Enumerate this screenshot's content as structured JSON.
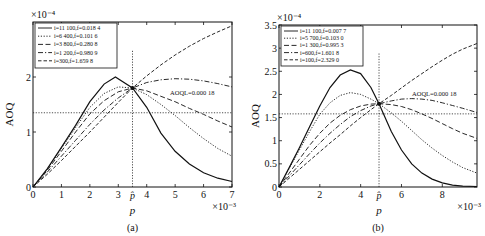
{
  "chart_data": [
    {
      "type": "line",
      "panel_label": "(a)",
      "xlabel": "p",
      "ylabel": "AOQ",
      "x_multiplier": "×10⁻³",
      "y_multiplier": "×10⁻⁴",
      "xlim": [
        0,
        7
      ],
      "ylim": [
        0,
        3
      ],
      "xticks": [
        0,
        1,
        2,
        3,
        4,
        5,
        6,
        7
      ],
      "yticks": [
        0,
        1,
        2
      ],
      "p_hat": 3.5,
      "p_hat_label": "p̂",
      "annotation": "AOQL=0.000 18",
      "hline": 1.35,
      "grid": false,
      "legend_position": "upper left",
      "series": [
        {
          "name": "i=11 100,f=0.018 4",
          "style": "solid",
          "x": [
            0,
            0.5,
            1,
            1.5,
            2,
            2.5,
            2.9,
            3.5,
            4,
            4.5,
            5,
            5.5,
            6,
            6.5,
            7
          ],
          "y": [
            0,
            0.33,
            0.72,
            1.12,
            1.55,
            1.87,
            2.0,
            1.8,
            1.45,
            0.98,
            0.65,
            0.42,
            0.26,
            0.16,
            0.1
          ]
        },
        {
          "name": "i=6 400,f=0.101 6",
          "style": "dotted",
          "x": [
            0,
            0.5,
            1,
            1.5,
            2,
            2.5,
            3,
            3.5,
            4,
            4.5,
            5,
            5.5,
            6,
            6.5,
            7
          ],
          "y": [
            0,
            0.32,
            0.7,
            1.08,
            1.45,
            1.7,
            1.82,
            1.8,
            1.68,
            1.5,
            1.3,
            1.08,
            0.88,
            0.7,
            0.56
          ]
        },
        {
          "name": "i=3 800,f=0.280 8",
          "style": "dashed",
          "x": [
            0,
            0.5,
            1,
            1.5,
            2,
            2.5,
            3,
            3.5,
            4,
            4.5,
            5,
            5.5,
            6,
            6.5,
            7
          ],
          "y": [
            0,
            0.3,
            0.65,
            1.0,
            1.33,
            1.57,
            1.73,
            1.8,
            1.75,
            1.65,
            1.55,
            1.43,
            1.32,
            1.2,
            1.09
          ]
        },
        {
          "name": "i=1 200,f=0.980 9",
          "style": "dashdot",
          "x": [
            0,
            0.5,
            1,
            1.5,
            2,
            2.5,
            3,
            3.5,
            4,
            4.5,
            5,
            5.5,
            6,
            6.5,
            7
          ],
          "y": [
            0,
            0.27,
            0.56,
            0.85,
            1.14,
            1.4,
            1.62,
            1.8,
            1.9,
            1.95,
            1.97,
            1.96,
            1.93,
            1.88,
            1.82
          ]
        },
        {
          "name": "i=300,f=1.659 8",
          "style": "longdash",
          "x": [
            0,
            0.5,
            1,
            1.5,
            2,
            2.5,
            3,
            3.5,
            4,
            4.5,
            5,
            5.5,
            6,
            6.5,
            7
          ],
          "y": [
            0,
            0.23,
            0.48,
            0.74,
            1.0,
            1.27,
            1.54,
            1.8,
            2.02,
            2.22,
            2.4,
            2.56,
            2.7,
            2.82,
            2.93
          ]
        }
      ]
    },
    {
      "type": "line",
      "panel_label": "(b)",
      "xlabel": "p",
      "ylabel": "AOQ",
      "x_multiplier": "×10⁻³",
      "y_multiplier": "×10⁻⁴",
      "xlim": [
        0,
        9.7
      ],
      "ylim": [
        0,
        3.5
      ],
      "xticks": [
        0,
        2,
        4,
        6,
        8
      ],
      "yticks": [
        0,
        0.5,
        1,
        1.5,
        2,
        2.5,
        3,
        3.5
      ],
      "p_hat": 4.9,
      "p_hat_label": "p̂",
      "annotation": "AOQL=0.000 18",
      "hline": 1.58,
      "grid": false,
      "legend_position": "upper left",
      "series": [
        {
          "name": "i=11 100,f=0.007 7",
          "style": "solid",
          "x": [
            0,
            0.5,
            1,
            1.5,
            2,
            2.5,
            3,
            3.5,
            4,
            4.5,
            4.9,
            5.5,
            6,
            6.5,
            7,
            7.5,
            8,
            8.5,
            9,
            9.7
          ],
          "y": [
            0,
            0.42,
            0.85,
            1.3,
            1.75,
            2.15,
            2.42,
            2.53,
            2.45,
            2.15,
            1.8,
            1.2,
            0.8,
            0.5,
            0.3,
            0.17,
            0.09,
            0.04,
            0.02,
            0.01
          ]
        },
        {
          "name": "i=5 700,f=0.103 0",
          "style": "dotted",
          "x": [
            0,
            0.5,
            1,
            1.5,
            2,
            2.5,
            3,
            3.5,
            4,
            4.5,
            4.9,
            5.5,
            6,
            6.5,
            7,
            7.5,
            8,
            8.5,
            9,
            9.7
          ],
          "y": [
            0,
            0.4,
            0.8,
            1.2,
            1.57,
            1.82,
            1.98,
            2.04,
            2.0,
            1.9,
            1.8,
            1.6,
            1.42,
            1.22,
            1.02,
            0.84,
            0.68,
            0.54,
            0.42,
            0.3
          ]
        },
        {
          "name": "i=1 300,f=0.995 3",
          "style": "dashed",
          "x": [
            0,
            0.5,
            1,
            1.5,
            2,
            2.5,
            3,
            3.5,
            4,
            4.5,
            4.9,
            5.5,
            6,
            6.5,
            7,
            7.5,
            8,
            8.5,
            9,
            9.7
          ],
          "y": [
            0,
            0.3,
            0.6,
            0.9,
            1.16,
            1.38,
            1.55,
            1.67,
            1.75,
            1.79,
            1.8,
            1.78,
            1.74,
            1.67,
            1.58,
            1.48,
            1.37,
            1.26,
            1.16,
            1.05
          ]
        },
        {
          "name": "i=600,f=1.601 8",
          "style": "dashdot",
          "x": [
            0,
            0.5,
            1,
            1.5,
            2,
            2.5,
            3,
            3.5,
            4,
            4.5,
            4.9,
            5.5,
            6,
            6.5,
            7,
            7.5,
            8,
            8.5,
            9,
            9.7
          ],
          "y": [
            0,
            0.24,
            0.48,
            0.72,
            0.95,
            1.16,
            1.35,
            1.52,
            1.65,
            1.75,
            1.8,
            1.86,
            1.9,
            1.91,
            1.9,
            1.87,
            1.82,
            1.76,
            1.7,
            1.61
          ]
        },
        {
          "name": "i=100,f=2.329 0",
          "style": "longdash",
          "x": [
            0,
            0.5,
            1,
            1.5,
            2,
            2.5,
            3,
            3.5,
            4,
            4.5,
            4.9,
            5.5,
            6,
            6.5,
            7,
            7.5,
            8,
            8.5,
            9,
            9.7
          ],
          "y": [
            0,
            0.19,
            0.38,
            0.57,
            0.76,
            0.95,
            1.13,
            1.32,
            1.5,
            1.67,
            1.8,
            1.98,
            2.14,
            2.3,
            2.45,
            2.6,
            2.74,
            2.87,
            2.98,
            3.1
          ]
        }
      ]
    }
  ]
}
